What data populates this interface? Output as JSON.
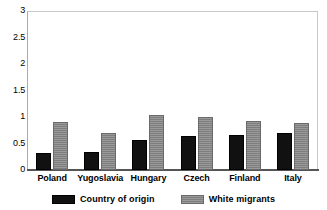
{
  "chart_data": {
    "type": "bar",
    "title": "",
    "subtitle": "",
    "xlabel": "",
    "ylabel": "",
    "categories": [
      "Poland",
      "Yugoslavia",
      "Hungary",
      "Czech",
      "Finland",
      "Italy"
    ],
    "series": [
      {
        "name": "Country of origin",
        "color": "#111111",
        "values": [
          0.33,
          0.35,
          0.57,
          0.64,
          0.66,
          0.7
        ]
      },
      {
        "name": "White migrants",
        "color": "#8d8d8d",
        "values": [
          0.92,
          0.71,
          1.05,
          1.0,
          0.94,
          0.9
        ]
      }
    ],
    "ylim": [
      0,
      3
    ],
    "ytick_values": [
      3,
      2.5,
      2,
      1.5,
      1,
      0.5,
      0
    ],
    "ytick_labels": [
      "3",
      "2.5",
      "2",
      "1.5",
      "1",
      "0.5",
      "0"
    ],
    "grid": false,
    "legend_position": "bottom"
  },
  "legend": {
    "entries": [
      {
        "label": "Country of origin"
      },
      {
        "label": "White migrants"
      }
    ]
  }
}
